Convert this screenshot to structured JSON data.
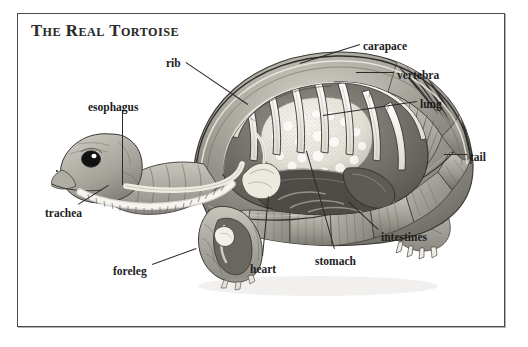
{
  "page": {
    "width": 528,
    "height": 347,
    "background": "#ffffff",
    "frame_color": "#4b4b4b"
  },
  "title": "The Real Tortoise",
  "illustration": {
    "subject": "tortoise-anatomical-cutaway",
    "description": "Side view cutaway illustration of a tortoise showing internal organs and skeleton beneath the carapace",
    "style": "grayscale-pencil-rendering",
    "palette": {
      "shell_mid": "#9a978f",
      "shell_light": "#cfccc4",
      "shell_dark": "#6d6a63",
      "skin": "#b2aea6",
      "bone": "#f2f0ea",
      "organ_light": "#e8e5dd",
      "outline": "#3a3834",
      "eye": "#151515",
      "eye_highlight": "#ffffff"
    }
  },
  "labels": [
    {
      "id": "rib",
      "text": "rib",
      "x": 166,
      "y": 58,
      "anchor": "left"
    },
    {
      "id": "carapace",
      "text": "carapace",
      "x": 363,
      "y": 41,
      "anchor": "left"
    },
    {
      "id": "vertebra",
      "text": "vertebra",
      "x": 397,
      "y": 70,
      "anchor": "left"
    },
    {
      "id": "lung",
      "text": "lung",
      "x": 420,
      "y": 99,
      "anchor": "left"
    },
    {
      "id": "tail",
      "text": "tail",
      "x": 470,
      "y": 152,
      "anchor": "left"
    },
    {
      "id": "intestines",
      "text": "intestines",
      "x": 381,
      "y": 232,
      "anchor": "left"
    },
    {
      "id": "stomach",
      "text": "stomach",
      "x": 315,
      "y": 256,
      "anchor": "left"
    },
    {
      "id": "heart",
      "text": "heart",
      "x": 250,
      "y": 264,
      "anchor": "left"
    },
    {
      "id": "foreleg",
      "text": "foreleg",
      "x": 113,
      "y": 266,
      "anchor": "left"
    },
    {
      "id": "trachea",
      "text": "trachea",
      "x": 45,
      "y": 208,
      "anchor": "left"
    },
    {
      "id": "esophagus",
      "text": "esophagus",
      "x": 88,
      "y": 102,
      "anchor": "left"
    }
  ],
  "leaders": [
    {
      "id": "rib",
      "x1": 186,
      "y1": 62,
      "x2": 248,
      "y2": 104
    },
    {
      "id": "carapace",
      "x1": 360,
      "y1": 45,
      "x2": 300,
      "y2": 64
    },
    {
      "id": "vertebra",
      "x1": 394,
      "y1": 73,
      "x2": 356,
      "y2": 73
    },
    {
      "id": "lung",
      "x1": 417,
      "y1": 102,
      "x2": 323,
      "y2": 116
    },
    {
      "id": "tail",
      "x1": 467,
      "y1": 155,
      "x2": 444,
      "y2": 155
    },
    {
      "id": "intestines",
      "x1": 378,
      "y1": 230,
      "x2": 348,
      "y2": 202
    },
    {
      "id": "stomach",
      "x1": 334,
      "y1": 249,
      "x2": 306,
      "y2": 151
    },
    {
      "id": "heart",
      "x1": 262,
      "y1": 256,
      "x2": 268,
      "y2": 196
    },
    {
      "id": "foreleg",
      "x1": 152,
      "y1": 264,
      "x2": 196,
      "y2": 248
    },
    {
      "id": "trachea",
      "x1": 78,
      "y1": 204,
      "x2": 108,
      "y2": 185
    },
    {
      "id": "esophagus",
      "x1": 123,
      "y1": 110,
      "x2": 123,
      "y2": 185
    }
  ]
}
